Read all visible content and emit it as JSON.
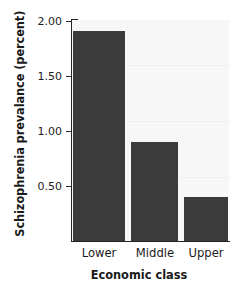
{
  "chart_data": {
    "type": "bar",
    "title": "",
    "categories": [
      "Lower",
      "Middle",
      "Upper"
    ],
    "values": [
      1.9,
      0.9,
      0.4
    ],
    "xlabel": "Economic class",
    "ylabel": "Schizophrenia prevalance (percent)",
    "ylim": [
      0.0,
      2.0
    ],
    "yticks": [
      "2.00",
      "1.50",
      "1.00",
      "0.50"
    ],
    "ytick_values": [
      2.0,
      1.5,
      1.0,
      0.5
    ],
    "grid": false,
    "legend": "none",
    "bar_color": "#3b3b3b",
    "plot_background": "#f7f7f7",
    "axis_color": "#242424",
    "text_color": "#1a1a1a"
  }
}
